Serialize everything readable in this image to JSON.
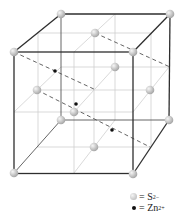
{
  "figure": {
    "structure": "face-centered cubic S2- lattice with Zn2+ in tetrahedral holes"
  },
  "colors": {
    "background": "#ffffff",
    "frame_edge": "#333333",
    "grid_line": "#c8c8c8",
    "dashed_line": "#555555",
    "sulfide_ball": "#c8c8c8",
    "zinc_dot": "#111111"
  },
  "cube": {
    "back": {
      "tl": [
        61,
        14
      ],
      "tr": [
        170,
        14
      ],
      "bl": [
        61,
        120
      ],
      "br": [
        169,
        120
      ]
    },
    "front": {
      "tl": [
        14,
        52
      ],
      "tr": [
        133,
        52
      ],
      "bl": [
        14,
        173
      ],
      "br": [
        133,
        174
      ]
    }
  },
  "sulfide_positions": [
    [
      61,
      14
    ],
    [
      170,
      14
    ],
    [
      61,
      120
    ],
    [
      169,
      120
    ],
    [
      14,
      52
    ],
    [
      133,
      52
    ],
    [
      14,
      173
    ],
    [
      133,
      174
    ],
    [
      95,
      33
    ],
    [
      115,
      67
    ],
    [
      37,
      90
    ],
    [
      150,
      90
    ],
    [
      74,
      112
    ],
    [
      94,
      147
    ]
  ],
  "zinc_positions": [
    [
      55,
      71
    ],
    [
      76,
      104
    ],
    [
      112,
      130
    ]
  ],
  "legend": {
    "items": [
      {
        "symbol": "ball",
        "eq": "= S",
        "sup": "2−",
        "label": "S2- (sulfide ion)"
      },
      {
        "symbol": "dot",
        "eq": "= Zn",
        "sup": "2+",
        "label": "Zn2+ (zinc ion)"
      }
    ]
  }
}
